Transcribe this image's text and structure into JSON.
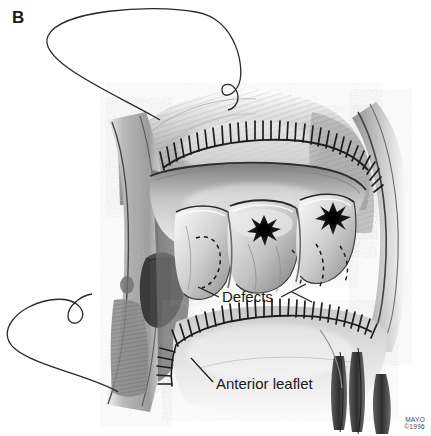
{
  "figure": {
    "panel_label": "B",
    "credit_line_1": "MAYO",
    "credit_line_2": "©1996",
    "background_color": "#ffffff",
    "ink_color": "#1a1a1a",
    "medium": "grayscale pen-and-ink medical illustration"
  },
  "annotations": [
    {
      "name": "defects",
      "text": "Defects",
      "x": 222,
      "y": 288,
      "leader_sides": [
        "left",
        "right"
      ]
    },
    {
      "name": "anterior-leaflet",
      "text": "Anterior leaflet",
      "x": 216,
      "y": 375,
      "leader_sides": [
        "left"
      ]
    }
  ],
  "anatomy": {
    "cusps_count": 3,
    "defect_lesions": 2,
    "defect_shape": "stellate",
    "suture_lines": 2,
    "suture_line_upper_stitches": 34,
    "suture_line_lower_stitches": 30,
    "free_suture_loops": 2
  },
  "palette": {
    "paper": "#ffffff",
    "line": "#222222",
    "tissue_light": "#e8e8e8",
    "tissue_mid": "#b4b4b4",
    "tissue_dark": "#7a7a7a",
    "tissue_deep": "#4a4a4a",
    "lesion": "#1c1c1c"
  }
}
